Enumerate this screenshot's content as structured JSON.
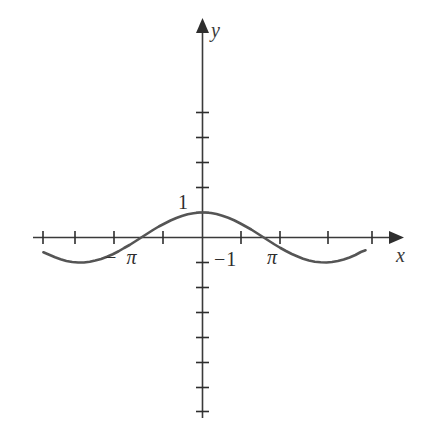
{
  "figure": {
    "name": "cosine-function-graph",
    "background_color": "#ffffff",
    "curve_color": "#555555",
    "axis_color": "#3a3a3a"
  },
  "axes": {
    "x_axis_label": "x",
    "y_axis_label": "y",
    "origin_px": {
      "x": 202,
      "y": 237
    },
    "x_unit_px": 39,
    "y_unit_px": 25
  },
  "labels": {
    "one": "1",
    "negative_one": "−1",
    "pi": "π",
    "negative_pi": "− π"
  },
  "chart_data": {
    "type": "line",
    "title": "",
    "xlabel": "x",
    "ylabel": "y",
    "grid": false,
    "legend": null,
    "function": "y = cos(x)",
    "xlim": [
      -4.1,
      4.95
    ],
    "ylim": [
      -5.0,
      4.3
    ],
    "x_tick_labels": [
      {
        "value": -3.1416,
        "text": "− π"
      },
      {
        "value": 3.1416,
        "text": "π"
      }
    ],
    "y_tick_labels": [
      {
        "value": 1,
        "text": "1"
      },
      {
        "value": -1,
        "text": "−1"
      }
    ],
    "x_tick_values": [
      -4.08,
      -3.14,
      -2.36,
      -1.57,
      -0.79,
      0.79,
      1.57,
      2.36,
      3.14,
      4.08
    ],
    "y_tick_values": [
      -5,
      -4,
      -3,
      -2,
      -1,
      1,
      2,
      3,
      4
    ],
    "x_domain_drawn": [
      -4.08,
      4.18
    ],
    "series": [
      {
        "name": "cos(x)",
        "x": [
          -4.08,
          -3.93,
          -3.78,
          -3.64,
          -3.49,
          -3.34,
          -3.19,
          -3.04,
          -2.89,
          -2.75,
          -2.6,
          -2.45,
          -2.3,
          -2.15,
          -2.01,
          -1.86,
          -1.71,
          -1.56,
          -1.41,
          -1.27,
          -1.12,
          -0.97,
          -0.82,
          -0.67,
          -0.53,
          -0.38,
          -0.23,
          -0.08,
          0.07,
          0.22,
          0.36,
          0.51,
          0.66,
          0.81,
          0.96,
          1.1,
          1.25,
          1.4,
          1.55,
          1.7,
          1.84,
          1.99,
          2.14,
          2.29,
          2.44,
          2.58,
          2.73,
          2.88,
          3.03,
          3.18,
          3.32,
          3.47,
          3.62,
          3.77,
          3.92,
          4.06,
          4.18
        ],
        "y": [
          -0.59,
          -0.69,
          -0.79,
          -0.87,
          -0.94,
          -0.98,
          -1.0,
          -1.0,
          -0.97,
          -0.92,
          -0.86,
          -0.77,
          -0.67,
          -0.55,
          -0.42,
          -0.29,
          -0.14,
          0.01,
          0.16,
          0.3,
          0.44,
          0.56,
          0.68,
          0.78,
          0.86,
          0.93,
          0.97,
          1.0,
          1.0,
          0.98,
          0.94,
          0.87,
          0.79,
          0.69,
          0.57,
          0.45,
          0.32,
          0.17,
          0.02,
          -0.13,
          -0.27,
          -0.41,
          -0.54,
          -0.66,
          -0.76,
          -0.85,
          -0.92,
          -0.97,
          -0.99,
          -1.0,
          -0.98,
          -0.94,
          -0.88,
          -0.8,
          -0.7,
          -0.58,
          -0.51
        ]
      }
    ]
  }
}
